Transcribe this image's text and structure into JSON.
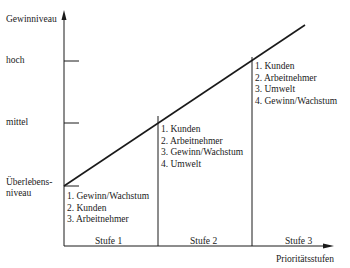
{
  "diagram": {
    "y_axis_label": "Gewinniveau",
    "x_axis_label": "Prioritätsstufen",
    "levels": [
      {
        "id": "hoch",
        "label": "hoch"
      },
      {
        "id": "mittel",
        "label": "mittel"
      },
      {
        "id": "ueberleben",
        "label_line1": "Überlebens-",
        "label_line2": "niveau"
      }
    ],
    "stages": [
      {
        "label": "Stufe 1",
        "priorities": [
          "1. Gewinn/Wachstum",
          "2. Kunden",
          "3. Arbeitnehmer"
        ]
      },
      {
        "label": "Stufe 2",
        "priorities": [
          "1. Kunden",
          "2. Arbeitnehmer",
          "3. Gewinn/Wachstum",
          "4. Umwelt"
        ]
      },
      {
        "label": "Stufe 3",
        "priorities": [
          "1. Kunden",
          "2. Arbeitnehmer",
          "3. Umwelt",
          "4. Gewinn/Wachstum"
        ]
      }
    ]
  }
}
